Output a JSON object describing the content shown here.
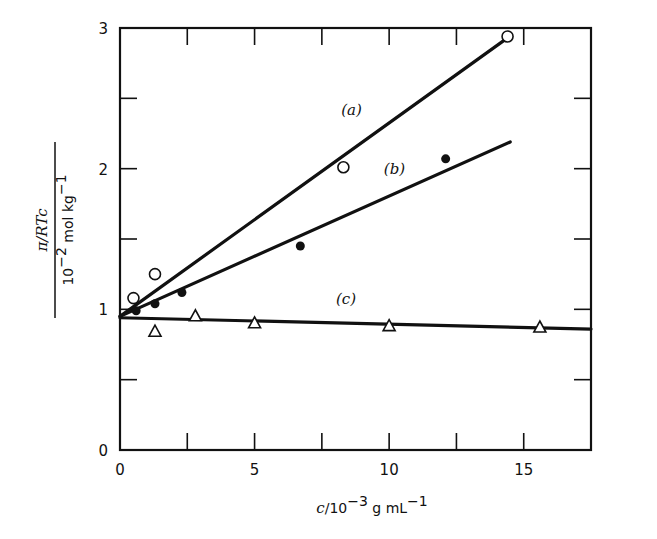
{
  "chart_data": {
    "type": "scatter",
    "title": "",
    "xlabel": "c/10^-3 g mL^-1",
    "ylabel": "π/RTc / 10^-2 mol kg^-1",
    "xlim": [
      0,
      17.5
    ],
    "ylim": [
      0,
      3
    ],
    "grid": false,
    "legend": "none (inline labels (a), (b), (c))",
    "x_ticks": [
      0,
      2.5,
      5,
      7.5,
      10,
      12.5,
      15
    ],
    "x_tick_labels": [
      "0",
      "",
      "5",
      "",
      "10",
      "",
      "15"
    ],
    "y_ticks": [
      0,
      0.5,
      1,
      1.5,
      2,
      2.5,
      3
    ],
    "y_tick_labels": [
      "0",
      "",
      "1",
      "",
      "2",
      "",
      "3"
    ],
    "series": [
      {
        "name": "(a)",
        "marker": "open-circle",
        "points": [
          [
            0.5,
            1.08
          ],
          [
            1.3,
            1.25
          ],
          [
            8.3,
            2.01
          ],
          [
            14.4,
            2.94
          ]
        ],
        "fit_line": [
          [
            0,
            0.95
          ],
          [
            14.4,
            2.93
          ]
        ]
      },
      {
        "name": "(b)",
        "marker": "filled-circle",
        "points": [
          [
            0.6,
            0.99
          ],
          [
            1.3,
            1.04
          ],
          [
            2.3,
            1.12
          ],
          [
            6.7,
            1.45
          ],
          [
            12.1,
            2.07
          ]
        ],
        "fit_line": [
          [
            0,
            0.95
          ],
          [
            14.5,
            2.19
          ]
        ]
      },
      {
        "name": "(c)",
        "marker": "open-triangle",
        "points": [
          [
            1.3,
            0.84
          ],
          [
            2.8,
            0.95
          ],
          [
            5.0,
            0.9
          ],
          [
            10.0,
            0.88
          ],
          [
            15.6,
            0.87
          ]
        ],
        "fit_line": [
          [
            0,
            0.94
          ],
          [
            17.5,
            0.86
          ]
        ]
      }
    ],
    "annotations": [
      {
        "text": "(a)",
        "x": 8.6,
        "y": 2.38
      },
      {
        "text": "(b)",
        "x": 10.2,
        "y": 1.96
      },
      {
        "text": "(c)",
        "x": 8.4,
        "y": 1.04
      }
    ]
  },
  "axes": {
    "x_label_prefix": "c",
    "x_label_rest": "/10",
    "x_label_exp": "−3",
    "x_label_unit": " g mL",
    "x_label_unit_exp": "−1",
    "y_label_top": "π/RTc",
    "y_label_bottom": "10",
    "y_label_bottom_exp": "−2",
    "y_label_bottom_unit": " mol kg",
    "y_label_bottom_unit_exp": "−1"
  }
}
